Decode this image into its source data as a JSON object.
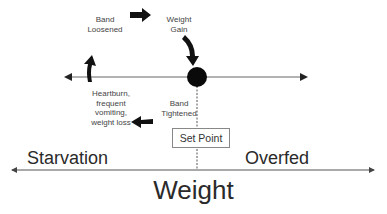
{
  "diagram": {
    "type": "feedback-cycle",
    "cycle_labels": {
      "band_loosened": "Band\nLoosened",
      "weight_gain": "Weight\nGain",
      "band_tightened": "Band\nTightened",
      "heartburn": "Heartburn,\nfrequent\nvomiting,\nweight loss"
    },
    "set_point": "Set Point",
    "regions": {
      "left": "Starvation",
      "right": "Overfed"
    },
    "axis_title": "Weight",
    "colors": {
      "arrow": "#111111",
      "line": "#555555",
      "text": "#333333"
    }
  }
}
